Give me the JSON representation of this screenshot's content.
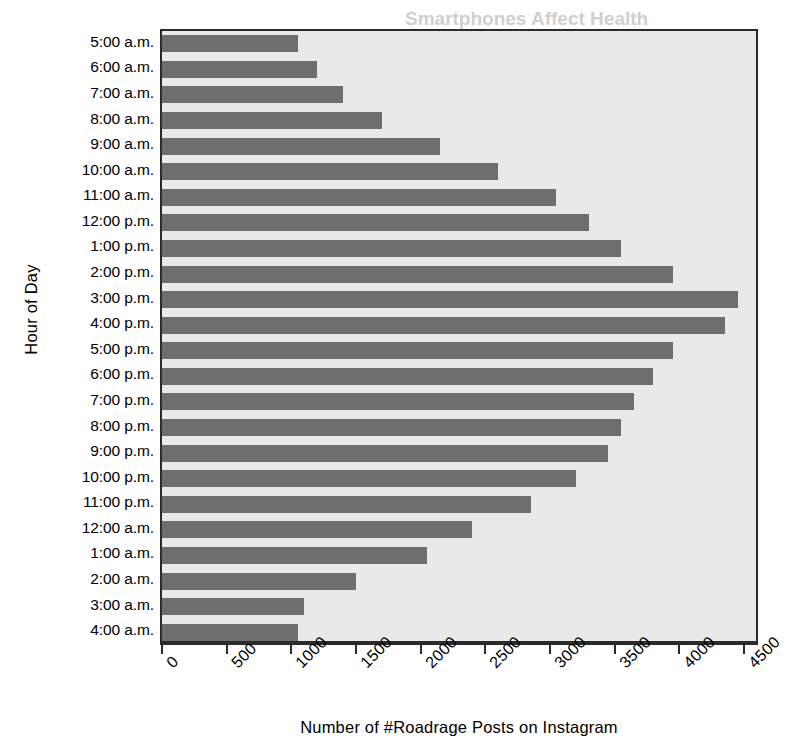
{
  "chart_data": {
    "type": "bar",
    "orientation": "horizontal",
    "title": "",
    "xlabel": "Number of #Roadrage Posts on Instagram",
    "ylabel": "Hour of Day",
    "categories": [
      "5:00 a.m.",
      "6:00 a.m.",
      "7:00 a.m.",
      "8:00 a.m.",
      "9:00 a.m.",
      "10:00 a.m.",
      "11:00 a.m.",
      "12:00 p.m.",
      "1:00 p.m.",
      "2:00 p.m.",
      "3:00 p.m.",
      "4:00 p.m.",
      "5:00 p.m.",
      "6:00 p.m.",
      "7:00 p.m.",
      "8:00 p.m.",
      "9:00 p.m.",
      "10:00 p.m.",
      "11:00 p.m.",
      "12:00 a.m.",
      "1:00 a.m.",
      "2:00 a.m.",
      "3:00 a.m.",
      "4:00 a.m."
    ],
    "values": [
      1050,
      1200,
      1400,
      1700,
      2150,
      2600,
      3050,
      3300,
      3550,
      3950,
      4450,
      4350,
      3950,
      3800,
      3650,
      3550,
      3450,
      3200,
      2850,
      2400,
      2050,
      1500,
      1100,
      1050
    ],
    "xlim": [
      0,
      4500
    ],
    "xticks": [
      0,
      500,
      1000,
      1500,
      2000,
      2500,
      3000,
      3500,
      4000,
      4500
    ],
    "xtick_labels": [
      "0",
      "500",
      "1000",
      "1500",
      "2000",
      "2500",
      "3000",
      "3500",
      "4000",
      "4500"
    ],
    "grid": false,
    "legend": null,
    "colors": {
      "bar": "#6e6e6e",
      "plot_background": "#e9e9e9",
      "axis": "#2b2b2b",
      "page_background": "#ffffff",
      "text": "#000000"
    }
  },
  "bleed_through": {
    "line1": "Smartphones Affect Health",
    "line2": "mobile use and its effects",
    "line3": "fects and social effects",
    "line4": "the bar",
    "line5": "Health and Society",
    "line6": "ses by a factor of three",
    "line7": "spread their own personal"
  }
}
